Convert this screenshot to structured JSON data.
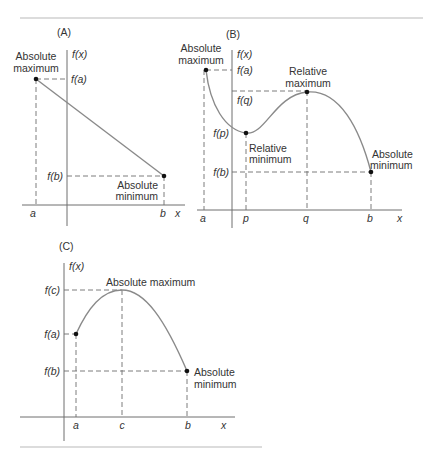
{
  "figure": {
    "panels": [
      {
        "id": "A",
        "title": "(A)",
        "y_axis_label": "f(x)",
        "x_axis_label": "x",
        "x_ticks": [
          "a",
          "b"
        ],
        "y_ticks": [
          "f(a)",
          "f(b)"
        ],
        "annotations": [
          {
            "text_lines": [
              "Absolute",
              "maximum"
            ],
            "point": "a",
            "value": "f(a)"
          },
          {
            "text_lines": [
              "Absolute",
              "minimum"
            ],
            "point": "b",
            "value": "f(b)"
          }
        ],
        "curve_shape": "straight line decreasing from (a, f(a)) to (b, f(b))"
      },
      {
        "id": "B",
        "title": "(B)",
        "y_axis_label": "f(x)",
        "x_axis_label": "x",
        "x_ticks": [
          "a",
          "p",
          "q",
          "b"
        ],
        "y_ticks": [
          "f(a)",
          "f(q)",
          "f(p)",
          "f(b)"
        ],
        "annotations": [
          {
            "text_lines": [
              "Absolute",
              "maximum"
            ],
            "point": "a",
            "value": "f(a)"
          },
          {
            "text_lines": [
              "Relative",
              "minimum"
            ],
            "point": "p",
            "value": "f(p)"
          },
          {
            "text_lines": [
              "Relative",
              "maximum"
            ],
            "point": "q",
            "value": "f(q)"
          },
          {
            "text_lines": [
              "Absolute",
              "minimum"
            ],
            "point": "b",
            "value": "f(b)"
          }
        ],
        "curve_shape": "decreases from a to relative min at p, rises to relative max at q, falls to b"
      },
      {
        "id": "C",
        "title": "(C)",
        "y_axis_label": "f(x)",
        "x_axis_label": "x",
        "x_ticks": [
          "a",
          "c",
          "b"
        ],
        "y_ticks": [
          "f(c)",
          "f(a)",
          "f(b)"
        ],
        "annotations": [
          {
            "text_lines": [
              "Absolute maximum"
            ],
            "point": "c",
            "value": "f(c)"
          },
          {
            "text_lines": [
              "Absolute",
              "minimum"
            ],
            "point": "b",
            "value": "f(b)"
          }
        ],
        "curve_shape": "rises from (a, f(a)) to peak at c, falls to (b, f(b))"
      }
    ]
  }
}
